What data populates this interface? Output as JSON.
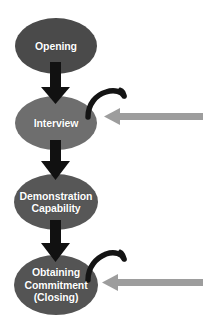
{
  "diagram": {
    "type": "flowchart",
    "background_color": "#ffffff",
    "nodes": [
      {
        "id": "opening",
        "lines": [
          "Opening"
        ],
        "shape": "ellipse",
        "fill": "#4a4a4a",
        "text_color": "#ffffff",
        "cx": 56,
        "cy": 46,
        "rx": 41,
        "ry": 28
      },
      {
        "id": "interview",
        "lines": [
          "Interview"
        ],
        "shape": "ellipse",
        "fill": "#6e6e6e",
        "text_color": "#ffffff",
        "cx": 56,
        "cy": 123,
        "rx": 41,
        "ry": 27
      },
      {
        "id": "demonstration-capability",
        "lines": [
          "Demonstration",
          "Capability"
        ],
        "shape": "ellipse",
        "fill": "#575757",
        "text_color": "#ffffff",
        "cx": 56,
        "cy": 202,
        "rx": 42,
        "ry": 28
      },
      {
        "id": "obtaining-commitment",
        "lines": [
          "Obtaining",
          "Commitment",
          "(Closing)"
        ],
        "shape": "ellipse",
        "fill": "#545454",
        "text_color": "#ffffff",
        "cx": 56,
        "cy": 285,
        "rx": 42,
        "ry": 30
      }
    ],
    "flow_arrows": [
      {
        "id": "opening-to-interview",
        "from": "opening",
        "to": "interview",
        "color": "#111111"
      },
      {
        "id": "interview-to-demonstration",
        "from": "interview",
        "to": "demonstration-capability",
        "color": "#111111"
      },
      {
        "id": "demonstration-to-obtaining",
        "from": "demonstration-capability",
        "to": "obtaining-commitment",
        "color": "#111111"
      }
    ],
    "callout_arrows": [
      {
        "id": "callout-interview",
        "points_to": "interview",
        "color": "#9d9d9d",
        "direction": "left"
      },
      {
        "id": "callout-obtaining-commitment",
        "points_to": "obtaining-commitment",
        "color": "#9d9d9d",
        "direction": "left"
      }
    ],
    "hooks": [
      {
        "id": "hook-interview",
        "attached_to": "interview",
        "color": "#141414"
      },
      {
        "id": "hook-obtaining-commitment",
        "attached_to": "obtaining-commitment",
        "color": "#141414"
      }
    ]
  }
}
